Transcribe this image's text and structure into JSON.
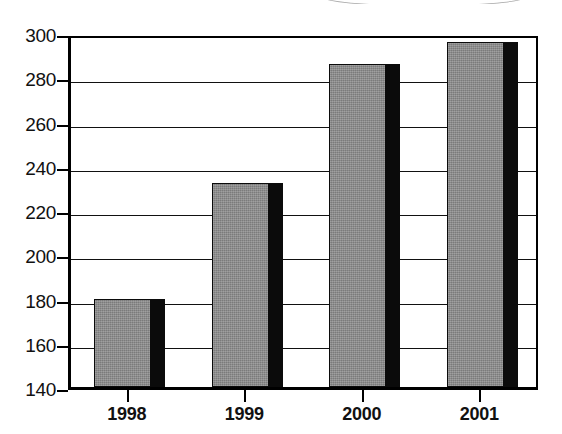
{
  "chart_data": {
    "type": "bar",
    "title": "",
    "subtitle": "",
    "xlabel": "",
    "ylabel": "",
    "categories": [
      "1998",
      "1999",
      "2000",
      "2001"
    ],
    "values": [
      180,
      232,
      286,
      296
    ],
    "series": [
      {
        "name": "",
        "values": [
          180,
          232,
          286,
          296
        ]
      }
    ],
    "ylim": [
      140,
      300
    ],
    "ytick_values": [
      140,
      160,
      180,
      200,
      220,
      240,
      260,
      280,
      300
    ],
    "ytick_labels": [
      "140",
      "160",
      "180",
      "200",
      "220",
      "240",
      "260",
      "280",
      "300"
    ],
    "ystep": 20,
    "grid": "horizontal",
    "legend": "none",
    "bar_style": "3d-shadow",
    "colors": {
      "bar_face": "#8a8a8a",
      "bar_side": "#0b0b0b",
      "axis": "#000000",
      "gridline": "#111111",
      "background": "#ffffff",
      "text": "#111111"
    }
  },
  "annotations": {
    "top_cropped_caption": ""
  }
}
